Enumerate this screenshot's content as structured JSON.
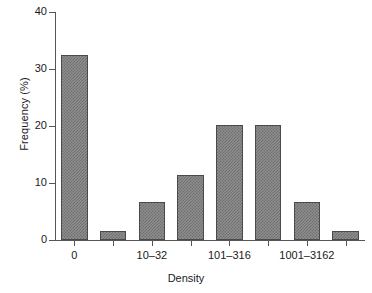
{
  "chart_data": {
    "type": "bar",
    "title": "",
    "xlabel": "Density",
    "ylabel": "Frequency (%)",
    "categories": [
      "0",
      "1–9",
      "10–32",
      "33–100",
      "101–316",
      "317–1000",
      "1001–3162",
      "3163–10000"
    ],
    "visible_tick_labels": [
      "0",
      "10–32",
      "101–316",
      "1001–3162"
    ],
    "values": [
      32.5,
      1.6,
      6.7,
      11.4,
      20.1,
      20.1,
      6.7,
      1.6
    ],
    "ylim": [
      0,
      40
    ],
    "yticks": [
      0,
      10,
      20,
      30,
      40
    ],
    "ytick_labels": [
      "0",
      "10",
      "20",
      "30",
      "40"
    ],
    "grid": false,
    "legend": false,
    "bar_color": "#8e8e8e",
    "bar_edge_color": "#4a4a4a",
    "axis_color": "#555555"
  }
}
